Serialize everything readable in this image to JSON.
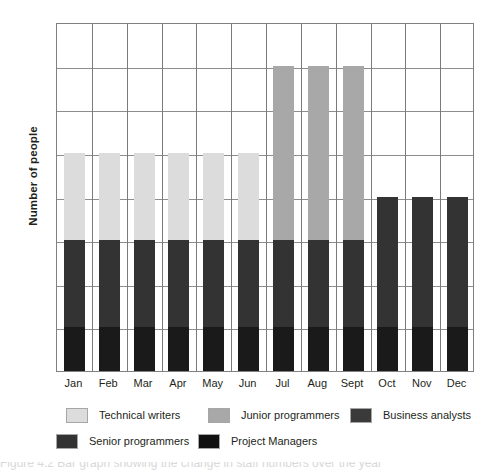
{
  "chart_data": {
    "type": "bar",
    "stacked": true,
    "title": "",
    "xlabel": "",
    "ylabel": "Number of people",
    "ylim": [
      0,
      8
    ],
    "yticks": [
      0,
      1,
      2,
      3,
      4,
      5,
      6,
      7,
      8
    ],
    "grid": true,
    "legend_position": "bottom",
    "categories": [
      "Jan",
      "Feb",
      "Mar",
      "Apr",
      "May",
      "Jun",
      "Jul",
      "Aug",
      "Sept",
      "Oct",
      "Nov",
      "Dec"
    ],
    "series": [
      {
        "name": "Project Managers",
        "color": "#1a1a1a",
        "values": [
          1,
          1,
          1,
          1,
          1,
          1,
          1,
          1,
          1,
          1,
          1,
          1
        ]
      },
      {
        "name": "Senior programmers",
        "color": "#333333",
        "values": [
          2,
          2,
          2,
          2,
          2,
          2,
          2,
          2,
          2,
          3,
          3,
          3
        ]
      },
      {
        "name": "Technical writers",
        "color": "#dcdcdc",
        "values": [
          2,
          2,
          2,
          2,
          2,
          2,
          0,
          0,
          0,
          0,
          0,
          0
        ]
      },
      {
        "name": "Junior programmers",
        "color": "#a8a8a8",
        "values": [
          0,
          0,
          0,
          0,
          0,
          0,
          4,
          4,
          4,
          0,
          0,
          0
        ]
      },
      {
        "name": "Business analysts",
        "color": "#3a3a3a",
        "values": [
          0,
          0,
          0,
          0,
          0,
          0,
          0,
          0,
          0,
          0,
          0,
          0
        ]
      }
    ],
    "totals": [
      5,
      5,
      5,
      5,
      5,
      5,
      7,
      7,
      7,
      4,
      4,
      4
    ]
  },
  "axis": {
    "y_title": "Number of people",
    "y_tick_labels": [
      "8",
      "7",
      "6",
      "5",
      "4",
      "3",
      "2",
      "1",
      "0"
    ],
    "x_tick_labels": [
      "Jan",
      "Feb",
      "Mar",
      "Apr",
      "May",
      "Jun",
      "Jul",
      "Aug",
      "Sept",
      "Oct",
      "Nov",
      "Dec"
    ]
  },
  "legend": {
    "row1": [
      {
        "label": "Technical writers",
        "color": "#dcdcdc"
      },
      {
        "label": "Junior programmers",
        "color": "#a8a8a8"
      },
      {
        "label": "Business analysts",
        "color": "#3a3a3a"
      }
    ],
    "row2": [
      {
        "label": "Senior programmers",
        "color": "#333333"
      },
      {
        "label": "Project Managers",
        "color": "#111111"
      }
    ]
  },
  "caption": {
    "text": "Figure 4.2    Bar graph showing the change in staff numbers over the year"
  },
  "colors": {
    "technical_writers": "#dcdcdc",
    "junior_programmers": "#a8a8a8",
    "business_analysts": "#3a3a3a",
    "senior_programmers": "#333333",
    "project_managers": "#111111",
    "gridline": "#8d8d8d",
    "axis": "#808080",
    "text": "#231f20"
  }
}
